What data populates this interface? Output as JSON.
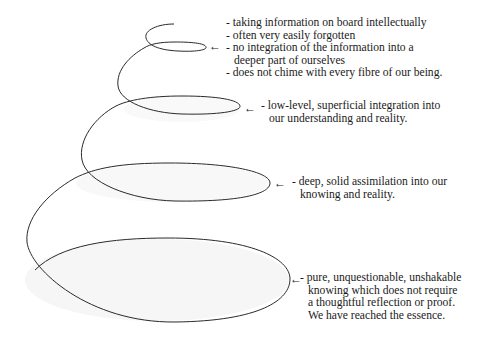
{
  "diagram": {
    "type": "spiral",
    "colors": {
      "stroke": "#2a2a2a",
      "fill": "#f7f7f7",
      "text": "#1a1a1a"
    },
    "levels": [
      {
        "name": "level-1",
        "arrow": "←",
        "lines": [
          "- taking information on board intellectually",
          "- often very easily forgotten",
          "- no integration of the information into a",
          "  deeper part of ourselves",
          "- does not chime with every fibre of our being."
        ]
      },
      {
        "name": "level-2",
        "arrow": "←",
        "lines": [
          "- low-level, superficial integration into",
          "  our understanding and reality."
        ]
      },
      {
        "name": "level-3",
        "arrow": "←",
        "lines": [
          "- deep, solid assimilation into our",
          "  knowing and reality."
        ]
      },
      {
        "name": "level-4",
        "arrow": "←",
        "lines": [
          "- pure, unquestionable, unshakable",
          "  knowing which does not require",
          "  a thoughtful reflection or proof.",
          "  We have reached the essence."
        ]
      }
    ]
  }
}
